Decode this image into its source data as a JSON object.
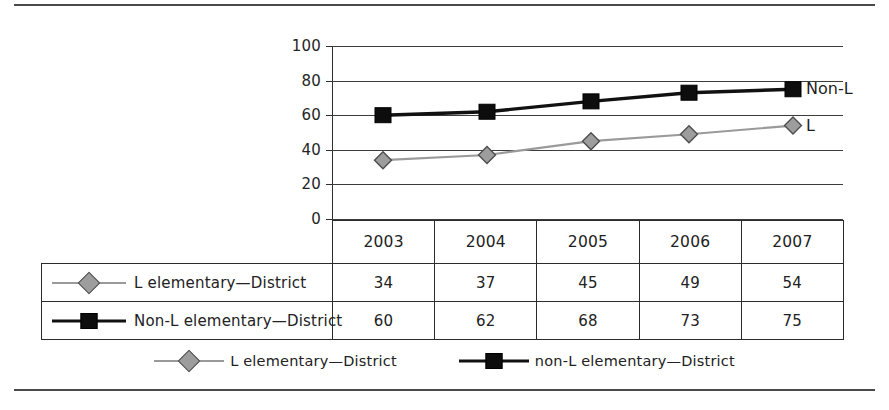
{
  "page": {
    "top_rule": "",
    "bottom_rule": ""
  },
  "chart_data": {
    "type": "line",
    "title": "",
    "subtitle": "",
    "xlabel": "",
    "ylabel": "",
    "categories": [
      "2003",
      "2004",
      "2005",
      "2006",
      "2007"
    ],
    "ylim": [
      0,
      100
    ],
    "yticks": [
      0,
      20,
      40,
      60,
      80,
      100
    ],
    "ytick_labels": [
      "0",
      "20",
      "40",
      "60",
      "80",
      "100"
    ],
    "grid": true,
    "legend_position": "bottom",
    "series": [
      {
        "name": "L elementary—District",
        "legend_name": "L elementary—District",
        "edge_annotation": "L",
        "marker": "diamond",
        "color": "#9d9d9d",
        "line_color": "#9a9a9a",
        "values": [
          34,
          37,
          45,
          49,
          54
        ]
      },
      {
        "name": "Non-L elementary—District",
        "legend_name": "non-L elementary—District",
        "edge_annotation": "Non-L",
        "marker": "square",
        "color": "#0d0d0d",
        "line_color": "#111111",
        "values": [
          60,
          62,
          68,
          73,
          75
        ]
      }
    ]
  },
  "table": {
    "corner_label": "",
    "header": [
      "2003",
      "2004",
      "2005",
      "2006",
      "2007"
    ],
    "rows": [
      {
        "label": "L elementary—District",
        "marker": "diamond",
        "values": [
          "34",
          "37",
          "45",
          "49",
          "54"
        ]
      },
      {
        "label": "Non-L elementary—District",
        "marker": "square",
        "values": [
          "60",
          "62",
          "68",
          "73",
          "75"
        ]
      }
    ]
  },
  "legend": {
    "items": [
      {
        "label": "L elementary—District",
        "marker": "diamond"
      },
      {
        "label": "non-L elementary—District",
        "marker": "square"
      }
    ]
  },
  "colors": {
    "series_gray": "#9d9d9d",
    "series_black": "#0d0d0d",
    "grid": "#3c3c3c",
    "text": "#222222"
  }
}
